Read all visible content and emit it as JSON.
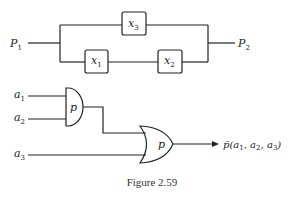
{
  "figure": {
    "caption": "Figure 2.59",
    "colors": {
      "stroke": "#222222",
      "background": "#ffffff"
    }
  },
  "circuit_switch": {
    "input_label": {
      "main": "P",
      "sub": "1"
    },
    "output_label": {
      "main": "P",
      "sub": "2"
    },
    "switches": [
      {
        "main": "x",
        "sub": "3",
        "branch": "top"
      },
      {
        "main": "x",
        "sub": "1",
        "branch": "bottom"
      },
      {
        "main": "x",
        "sub": "2",
        "branch": "bottom"
      }
    ]
  },
  "circuit_gates": {
    "inputs": [
      {
        "main": "a",
        "sub": "1"
      },
      {
        "main": "a",
        "sub": "2"
      },
      {
        "main": "a",
        "sub": "3"
      }
    ],
    "and_gate_label": "p",
    "or_gate_label": "p",
    "output_label": {
      "func": "p̄(",
      "args": [
        {
          "main": "a",
          "sub": "1"
        },
        {
          "main": "a",
          "sub": "2"
        },
        {
          "main": "a",
          "sub": "3"
        }
      ],
      "close": ")"
    }
  }
}
